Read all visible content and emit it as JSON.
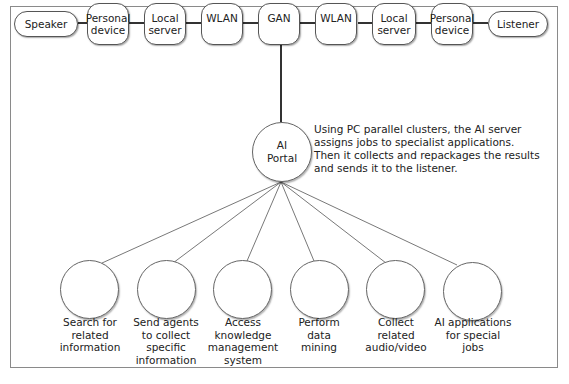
{
  "diagram": {
    "title": "",
    "chain": [
      {
        "id": "speaker",
        "label": "Speaker"
      },
      {
        "id": "personal-device-1",
        "label": "Personal\ndevice"
      },
      {
        "id": "local-server-1",
        "label": "Local\nserver"
      },
      {
        "id": "wlan-1",
        "label": "WLAN"
      },
      {
        "id": "gan",
        "label": "GAN"
      },
      {
        "id": "wlan-2",
        "label": "WLAN"
      },
      {
        "id": "local-server-2",
        "label": "Local\nserver"
      },
      {
        "id": "personal-device-2",
        "label": "Personal\ndevice"
      },
      {
        "id": "listener",
        "label": "Listener"
      }
    ],
    "portal": {
      "label": "AI\nPortal",
      "note": "Using PC parallel clusters, the AI server\nassigns jobs to specialist applications.\nThen it collects and repackages the results\nand sends it to the listener."
    },
    "applications": [
      {
        "id": "search",
        "label": "Search for\nrelated\ninformation"
      },
      {
        "id": "agents",
        "label": "Send agents\nto collect\nspecific\ninformation"
      },
      {
        "id": "knowledge",
        "label": "Access\nknowledge\nmanagement\nsystem"
      },
      {
        "id": "mining",
        "label": "Perform\ndata\nmining"
      },
      {
        "id": "audio-video",
        "label": "Collect\nrelated\naudio/video"
      },
      {
        "id": "ai-apps",
        "label": "AI applications\nfor special\njobs"
      }
    ],
    "colors": {
      "stroke": "#555555",
      "frame": "#8a8a8a",
      "background": "#ffffff",
      "text": "#222222"
    }
  }
}
